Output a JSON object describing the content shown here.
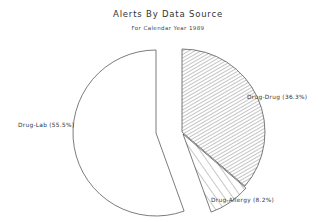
{
  "chart_data": {
    "type": "pie",
    "title": "Alerts By Data Source",
    "subtitle": "For Calendar Year 1989",
    "slices": [
      {
        "label": "Drug-Drug",
        "value": 36.3,
        "display": "Drug-Drug (36.3%)",
        "pattern": "dense-diagonal-hatch",
        "exploded": false
      },
      {
        "label": "Drug-Allergy",
        "value": 8.2,
        "display": "Drug-Allergy (8.2%)",
        "pattern": "sparse-diagonal-hatch",
        "exploded": false
      },
      {
        "label": "Drug-Lab",
        "value": 55.5,
        "display": "Drug-Lab (55.5%)",
        "pattern": "none",
        "exploded": true
      }
    ],
    "categories": [
      "Drug-Drug",
      "Drug-Allergy",
      "Drug-Lab"
    ],
    "values": [
      36.3,
      8.2,
      55.5
    ],
    "units": "%",
    "legend": "none (inline labels)"
  },
  "labels": {
    "drug_drug": "Drug-Drug (36.3%)",
    "drug_allergy": "Drug-Allergy (8.2%)",
    "drug_lab": "Drug-Lab (55.5%)"
  }
}
